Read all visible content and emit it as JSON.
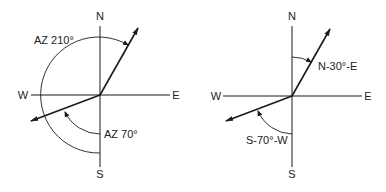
{
  "colors": {
    "line": "#1a1a1a",
    "background": "#ffffff"
  },
  "diagrams": [
    {
      "id": "azimuth",
      "compass": {
        "north": "N",
        "south": "S",
        "east": "E",
        "west": "W"
      },
      "annotations": [
        {
          "label": "AZ 210°",
          "bearing_deg": 30
        },
        {
          "label": "AZ 70°",
          "bearing_deg": 250
        }
      ]
    },
    {
      "id": "bearing",
      "compass": {
        "north": "N",
        "south": "S",
        "east": "E",
        "west": "W"
      },
      "annotations": [
        {
          "label": "N-30°-E",
          "bearing_deg": 30
        },
        {
          "label": "S-70°-W",
          "bearing_deg": 250
        }
      ]
    }
  ]
}
